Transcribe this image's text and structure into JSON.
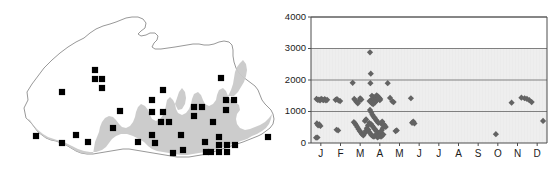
{
  "figure": {
    "panels": [
      "map-panel",
      "chart-panel"
    ],
    "background_color": "#ffffff"
  },
  "map": {
    "name": "bhutan-distribution-map",
    "outline_color": "#8c8c8c",
    "shaded_area_color": "#c9c9c9",
    "marker_color": "#000000",
    "marker_shape": "square",
    "marker_count": 41,
    "markers": [
      {
        "x": 95,
        "y": 70
      },
      {
        "x": 95,
        "y": 79
      },
      {
        "x": 102,
        "y": 79
      },
      {
        "x": 102,
        "y": 88
      },
      {
        "x": 62,
        "y": 92
      },
      {
        "x": 163,
        "y": 90
      },
      {
        "x": 221,
        "y": 78
      },
      {
        "x": 152,
        "y": 100
      },
      {
        "x": 120,
        "y": 111
      },
      {
        "x": 163,
        "y": 112
      },
      {
        "x": 194,
        "y": 107
      },
      {
        "x": 202,
        "y": 107
      },
      {
        "x": 194,
        "y": 116
      },
      {
        "x": 226,
        "y": 100
      },
      {
        "x": 234,
        "y": 100
      },
      {
        "x": 226,
        "y": 110
      },
      {
        "x": 161,
        "y": 122
      },
      {
        "x": 169,
        "y": 122
      },
      {
        "x": 113,
        "y": 128
      },
      {
        "x": 152,
        "y": 135
      },
      {
        "x": 36,
        "y": 136
      },
      {
        "x": 76,
        "y": 135
      },
      {
        "x": 62,
        "y": 143
      },
      {
        "x": 138,
        "y": 142
      },
      {
        "x": 181,
        "y": 135
      },
      {
        "x": 219,
        "y": 137
      },
      {
        "x": 219,
        "y": 145
      },
      {
        "x": 227,
        "y": 145
      },
      {
        "x": 211,
        "y": 152
      },
      {
        "x": 219,
        "y": 152
      },
      {
        "x": 227,
        "y": 152
      },
      {
        "x": 183,
        "y": 150
      },
      {
        "x": 206,
        "y": 152
      },
      {
        "x": 268,
        "y": 137
      },
      {
        "x": 205,
        "y": 142
      },
      {
        "x": 152,
        "y": 112
      },
      {
        "x": 155,
        "y": 143
      },
      {
        "x": 88,
        "y": 142
      },
      {
        "x": 235,
        "y": 145
      },
      {
        "x": 213,
        "y": 122
      },
      {
        "x": 173,
        "y": 153
      }
    ]
  },
  "chart_data": {
    "type": "scatter",
    "title": "",
    "xlabel": "",
    "ylabel": "",
    "xlim": [
      0,
      12
    ],
    "ylim": [
      0,
      4000
    ],
    "grid": true,
    "gridlines_y": [
      1000,
      2000,
      3000,
      4000
    ],
    "ytick_labels": [
      "0",
      "1000",
      "2000",
      "3000",
      "4000"
    ],
    "ytick_values": [
      0,
      1000,
      2000,
      3000,
      4000
    ],
    "xtick_labels": [
      "J",
      "F",
      "M",
      "A",
      "M",
      "J",
      "J",
      "A",
      "S",
      "O",
      "N",
      "D"
    ],
    "xtick_values": [
      0.5,
      1.5,
      2.5,
      3.5,
      4.5,
      5.5,
      6.5,
      7.5,
      8.5,
      9.5,
      10.5,
      11.5
    ],
    "marker_shape": "diamond",
    "marker_color": "#636363",
    "marker_size": 5,
    "plot_bg_below_3000": "#ebebeb",
    "plot_bg_above_3000": "#ffffff",
    "frame_color": "#4d4d4d",
    "gridline_color": "#808080",
    "series": [
      {
        "name": "records",
        "points": [
          [
            0.28,
            1400
          ],
          [
            0.34,
            1370
          ],
          [
            0.4,
            1380
          ],
          [
            0.46,
            1350
          ],
          [
            0.52,
            1400
          ],
          [
            0.58,
            1380
          ],
          [
            0.64,
            1360
          ],
          [
            0.7,
            1390
          ],
          [
            0.76,
            1350
          ],
          [
            0.82,
            1370
          ],
          [
            0.3,
            620
          ],
          [
            0.36,
            560
          ],
          [
            0.42,
            590
          ],
          [
            0.48,
            540
          ],
          [
            0.26,
            170
          ],
          [
            0.33,
            175
          ],
          [
            1.25,
            1370
          ],
          [
            1.32,
            1390
          ],
          [
            1.4,
            1350
          ],
          [
            1.48,
            1330
          ],
          [
            1.3,
            420
          ],
          [
            1.38,
            400
          ],
          [
            2.12,
            1910
          ],
          [
            2.2,
            1400
          ],
          [
            2.26,
            1350
          ],
          [
            2.32,
            1300
          ],
          [
            2.38,
            1260
          ],
          [
            2.44,
            1330
          ],
          [
            2.5,
            1420
          ],
          [
            2.56,
            1380
          ],
          [
            2.18,
            660
          ],
          [
            2.24,
            620
          ],
          [
            2.3,
            560
          ],
          [
            2.36,
            500
          ],
          [
            2.42,
            440
          ],
          [
            2.48,
            380
          ],
          [
            2.54,
            330
          ],
          [
            2.6,
            280
          ],
          [
            2.66,
            240
          ],
          [
            2.72,
            300
          ],
          [
            2.78,
            380
          ],
          [
            2.84,
            470
          ],
          [
            2.9,
            560
          ],
          [
            2.96,
            640
          ],
          [
            2.74,
            700
          ],
          [
            2.8,
            750
          ],
          [
            3.0,
            2880
          ],
          [
            3.04,
            2200
          ],
          [
            3.02,
            1900
          ],
          [
            3.1,
            1500
          ],
          [
            3.16,
            1460
          ],
          [
            3.22,
            1430
          ],
          [
            3.28,
            1470
          ],
          [
            3.34,
            1510
          ],
          [
            3.4,
            1480
          ],
          [
            3.46,
            1440
          ],
          [
            3.52,
            1400
          ],
          [
            3.08,
            1380
          ],
          [
            3.14,
            1350
          ],
          [
            3.2,
            1320
          ],
          [
            3.26,
            1290
          ],
          [
            3.32,
            1340
          ],
          [
            3.38,
            1390
          ],
          [
            3.44,
            1420
          ],
          [
            3.5,
            1360
          ],
          [
            2.98,
            1330
          ],
          [
            3.04,
            1300
          ],
          [
            3.1,
            1260
          ],
          [
            3.16,
            1230
          ],
          [
            3.0,
            1050
          ],
          [
            3.06,
            980
          ],
          [
            3.12,
            900
          ],
          [
            3.18,
            840
          ],
          [
            3.24,
            790
          ],
          [
            3.3,
            740
          ],
          [
            3.36,
            690
          ],
          [
            3.42,
            640
          ],
          [
            3.05,
            600
          ],
          [
            3.11,
            550
          ],
          [
            3.17,
            500
          ],
          [
            3.23,
            450
          ],
          [
            3.29,
            400
          ],
          [
            3.35,
            360
          ],
          [
            3.41,
            320
          ],
          [
            3.47,
            290
          ],
          [
            3.53,
            340
          ],
          [
            3.59,
            400
          ],
          [
            3.65,
            470
          ],
          [
            3.71,
            540
          ],
          [
            2.92,
            420
          ],
          [
            2.96,
            350
          ],
          [
            3.02,
            300
          ],
          [
            3.08,
            250
          ],
          [
            3.14,
            220
          ],
          [
            3.2,
            200
          ],
          [
            3.26,
            230
          ],
          [
            3.32,
            270
          ],
          [
            3.38,
            180
          ],
          [
            3.44,
            200
          ],
          [
            3.5,
            240
          ],
          [
            3.56,
            200
          ],
          [
            3.62,
            230
          ],
          [
            3.68,
            270
          ],
          [
            3.56,
            620
          ],
          [
            3.62,
            680
          ],
          [
            3.68,
            600
          ],
          [
            3.74,
            560
          ],
          [
            3.8,
            510
          ],
          [
            3.9,
            1900
          ],
          [
            4.02,
            1430
          ],
          [
            4.14,
            1320
          ],
          [
            4.2,
            1300
          ],
          [
            4.3,
            380
          ],
          [
            4.36,
            400
          ],
          [
            5.08,
            1420
          ],
          [
            5.2,
            680
          ],
          [
            5.26,
            620
          ],
          [
            5.14,
            640
          ],
          [
            9.4,
            280
          ],
          [
            10.2,
            1280
          ],
          [
            10.7,
            1440
          ],
          [
            10.86,
            1420
          ],
          [
            10.98,
            1400
          ],
          [
            11.1,
            1360
          ],
          [
            11.22,
            1300
          ],
          [
            11.8,
            700
          ]
        ]
      }
    ]
  }
}
